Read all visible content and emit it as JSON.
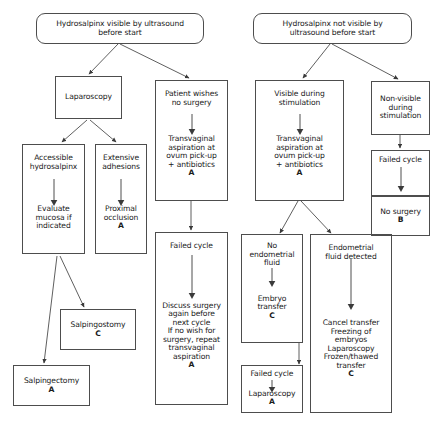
{
  "diagram": {
    "title_left": "Hydrosalpinx visible by ultrasound\nbefore start",
    "title_right": "Hydrosalpinx  not visible by\nultrasound before start",
    "line_color": "#4d4d4d",
    "text_color": "#1a1a1a",
    "background": "#ffffff"
  },
  "nodes": {
    "root_left": {
      "text": "Hydrosalpinx visible by ultrasound\nbefore start",
      "grade": ""
    },
    "root_right": {
      "text": "Hydrosalpinx  not visible by\nultrasound before start",
      "grade": ""
    },
    "laparoscopy": {
      "text": "Laparoscopy",
      "grade": ""
    },
    "accessible": {
      "text": "Accessible\nhydrosalpinx",
      "grade": ""
    },
    "evaluate_mucosa": {
      "text": "Evaluate\nmucosa if\nindicated",
      "grade": ""
    },
    "extensive": {
      "text": "Extensive\nadhesions",
      "grade": ""
    },
    "proximal": {
      "text": "Proximal\nocclusion",
      "grade": "A"
    },
    "salpingostomy": {
      "text": "Salpingostomy",
      "grade": "C"
    },
    "salpingectomy": {
      "text": "Salpingectomy",
      "grade": "A"
    },
    "patient_wishes": {
      "text": "Patient wishes\nno surgery",
      "grade": ""
    },
    "transvaginal_mid": {
      "text": "Transvaginal\naspiration at\novum pick-up\n+ antibiotics",
      "grade": "A"
    },
    "failed_cycle_mid": {
      "text": "Failed cycle",
      "grade": ""
    },
    "discuss_surgery": {
      "text": "Discuss surgery\nagain before\nnext cycle\nIf no wish for\nsurgery, repeat\ntransvaginal\naspiration",
      "grade": "A"
    },
    "visible_during": {
      "text": "Visible during\nstimulation",
      "grade": ""
    },
    "transvaginal_right": {
      "text": "Transvaginal\naspiration at\novum pick-up\n+ antibiotics",
      "grade": "A"
    },
    "no_endometrial_fluid": {
      "text": "No\nendometrial\nfluid",
      "grade": ""
    },
    "embryo_transfer": {
      "text": "Embryo\ntransfer",
      "grade": "C"
    },
    "failed_cycle_lap": {
      "text": "Failed cycle",
      "grade": ""
    },
    "laparoscopy_2": {
      "text": "Laparoscopy",
      "grade": "A"
    },
    "endometrial_fluid_detected": {
      "text": "Endometrial\nfluid detected",
      "grade": ""
    },
    "cancel_transfer": {
      "text": "Cancel transfer\nFreezing of\nembryos\nLaparoscopy\nFrozen/thawed\ntransfer",
      "grade": "C"
    },
    "non_visible": {
      "text": "Non-visible\nduring\nstimulation",
      "grade": ""
    },
    "failed_cycle_right": {
      "text": "Failed cycle",
      "grade": ""
    },
    "no_surgery": {
      "text": "No surgery",
      "grade": "B"
    }
  }
}
